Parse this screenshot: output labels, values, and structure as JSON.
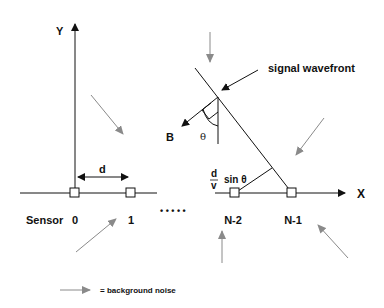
{
  "diagram": {
    "axes": {
      "x_label": "X",
      "y_label": "Y"
    },
    "spacing_label": "d",
    "delay_label": {
      "numerator": "d",
      "denominator": "v",
      "suffix": "sin θ"
    },
    "angle_label": "θ",
    "bearing_label": "B",
    "wavefront_label": "signal wavefront",
    "sensor_label": "Sensor",
    "sensors": [
      {
        "id": "0",
        "label": "0"
      },
      {
        "id": "1",
        "label": "1"
      },
      {
        "id": "n-2",
        "label": "N-2"
      },
      {
        "id": "n-1",
        "label": "N-1"
      }
    ],
    "ellipsis": "• • • • •",
    "legend": {
      "text": "= background noise",
      "icon": "gray-arrow-icon"
    },
    "colors": {
      "ink": "#111111",
      "noise": "#8a8a8a",
      "sensor_fill": "#ffffff"
    }
  }
}
